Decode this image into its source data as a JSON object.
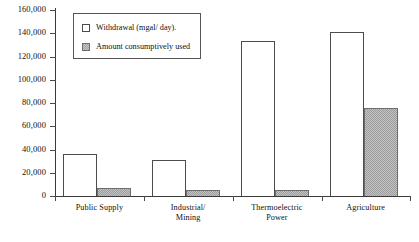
{
  "chart_data": {
    "type": "bar",
    "title": "",
    "xlabel": "",
    "ylabel": "",
    "ylim": [
      0,
      160000
    ],
    "grid": false,
    "legend_position": "top-left",
    "categories": [
      "Public Supply",
      "Industrial/\nMining",
      "Thermoelectric\nPower",
      "Agriculture"
    ],
    "ytick_labels": [
      "160,000",
      "140,000",
      "120,000",
      "100,000",
      "80,000",
      "60,000",
      "40,000",
      "20,000",
      "0"
    ],
    "ytick_values": [
      160000,
      140000,
      120000,
      100000,
      80000,
      60000,
      40000,
      20000,
      0
    ],
    "series": [
      {
        "name": "Withdrawal (mgal/ day).",
        "values": [
          36000,
          31000,
          133000,
          141000
        ]
      },
      {
        "name": "Amount consumptively used",
        "values": [
          7000,
          5000,
          5000,
          76000
        ]
      }
    ]
  },
  "legend": {
    "entries": [
      {
        "label": "Withdrawal (mgal/ day).",
        "swatch": "white-square-outline"
      },
      {
        "label": "Amount consumptively used",
        "swatch": "gray-filled-square"
      }
    ]
  },
  "colors": {
    "withdrawal_fill": "#ffffff",
    "withdrawal_border": "#4c4c4c",
    "consumptive_fill": "#a6a6a6",
    "consumptive_border": "#6d6d6d",
    "axis": "#3a3a3a",
    "text": "#111111",
    "background": "#ffffff"
  }
}
